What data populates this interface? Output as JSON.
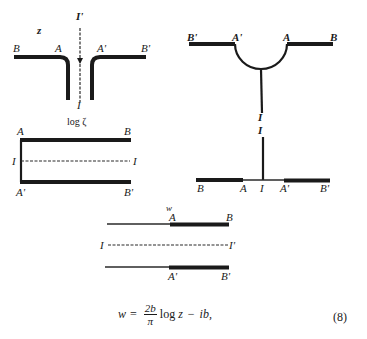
{
  "figure": {
    "panels": [
      {
        "id": "z-plane",
        "plane_label": "z",
        "labels": {
          "B": "B",
          "A": "A",
          "A_prime": "A'",
          "B_prime": "B'",
          "I_prime": "I'",
          "I": "I"
        }
      },
      {
        "id": "log-zeta-plane",
        "plane_label": "log ζ",
        "labels": {
          "A": "A",
          "B": "B",
          "I_left": "I",
          "I_right": "I",
          "A_prime": "A'",
          "B_prime": "B'"
        }
      },
      {
        "id": "upper-right-plane",
        "labels": {
          "B_prime": "B'",
          "A_prime": "A'",
          "A": "A",
          "B": "B",
          "I": "I"
        }
      },
      {
        "id": "real-axis-plane",
        "labels": {
          "I_top": "I",
          "B": "B",
          "A": "A",
          "I": "I",
          "A_prime": "A'",
          "B_prime": "B'"
        }
      },
      {
        "id": "w-plane",
        "plane_label": "w",
        "labels": {
          "A": "A",
          "B": "B",
          "I": "I",
          "I_prime": "I'",
          "A_prime": "A'",
          "B_prime": "B'"
        }
      }
    ],
    "equation": {
      "lhs": "w",
      "equals": "=",
      "frac_num": "2b",
      "frac_den": "π",
      "log": "log",
      "var": "z",
      "minus": "−",
      "tail": "ib,",
      "number": "(8)"
    }
  }
}
